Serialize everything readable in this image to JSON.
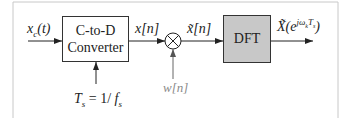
{
  "diagram": {
    "input_signal": {
      "base": "x",
      "sub": "c",
      "arg": "(t)"
    },
    "converter_block": {
      "line1": "C-to-D",
      "line2": "Converter"
    },
    "sampling_label": {
      "T": "T",
      "T_sub": "s",
      "eq": " = 1/ ",
      "f": "f",
      "f_sub": "s"
    },
    "sampled_signal": {
      "base": "x",
      "arg": "[n]"
    },
    "window_signal": {
      "base": "w",
      "arg": "[n]"
    },
    "windowed_signal": {
      "base": "x̃",
      "arg": "[n]"
    },
    "dft_block": {
      "label": "DFT"
    },
    "output_signal": {
      "base": "X̃",
      "open": "(e",
      "sup": "jω",
      "sup_sub": "k",
      "sup_T": "T",
      "sup_T_sub": "s",
      "close": ")"
    },
    "multiplier_symbol": "multiply",
    "colors": {
      "frame": "#c8c8c8",
      "line": "#333333",
      "dft_fill": "#c8c8c8",
      "window_line": "#8a8a8a"
    }
  }
}
